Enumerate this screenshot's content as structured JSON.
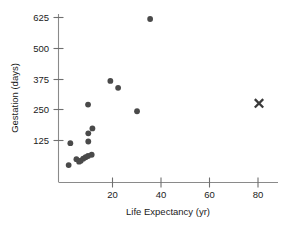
{
  "chart_data": {
    "type": "scatter",
    "title": "",
    "xlabel": "Life Expectancy (yr)",
    "ylabel": "Gestation (days)",
    "xlim": [
      0,
      85
    ],
    "ylim": [
      0,
      660
    ],
    "grid": false,
    "legend": "none",
    "xticks": [
      20,
      40,
      60,
      80
    ],
    "yticks": [
      125,
      250,
      375,
      500,
      625
    ],
    "xtick_labels": [
      "20",
      "40",
      "60",
      "80"
    ],
    "ytick_labels": [
      "125",
      "250",
      "375",
      "500",
      "625"
    ],
    "series": [
      {
        "name": "animals",
        "marker": "circle",
        "color": "#4a4a4a",
        "points": [
          {
            "x": 2.0,
            "y": 26
          },
          {
            "x": 2.7,
            "y": 115
          },
          {
            "x": 5.2,
            "y": 50
          },
          {
            "x": 6.3,
            "y": 40
          },
          {
            "x": 7.0,
            "y": 44
          },
          {
            "x": 8.0,
            "y": 52
          },
          {
            "x": 9.0,
            "y": 58
          },
          {
            "x": 10.0,
            "y": 63
          },
          {
            "x": 10.1,
            "y": 122
          },
          {
            "x": 10.1,
            "y": 155
          },
          {
            "x": 10.0,
            "y": 272
          },
          {
            "x": 11.5,
            "y": 68
          },
          {
            "x": 11.8,
            "y": 175
          },
          {
            "x": 19.2,
            "y": 368
          },
          {
            "x": 22.4,
            "y": 340
          },
          {
            "x": 30.2,
            "y": 245
          },
          {
            "x": 35.6,
            "y": 620
          }
        ]
      },
      {
        "name": "human-outlier",
        "marker": "x",
        "color": "#3a3a3a",
        "points": [
          {
            "x": 80.5,
            "y": 277
          }
        ]
      }
    ]
  }
}
